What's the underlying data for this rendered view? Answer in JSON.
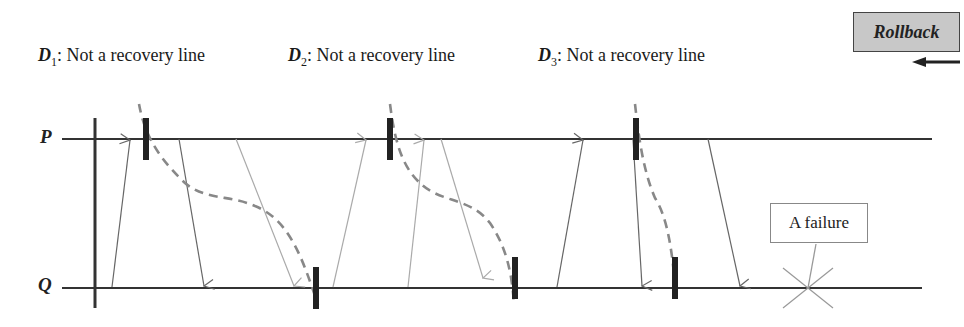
{
  "labels": {
    "d1": {
      "var": "D",
      "sub": "1",
      "text": ": Not a recovery line"
    },
    "d2": {
      "var": "D",
      "sub": "2",
      "text": ": Not a recovery line"
    },
    "d3": {
      "var": "D",
      "sub": "3",
      "text": ": Not a recovery line"
    }
  },
  "processes": {
    "p": "P",
    "q": "Q"
  },
  "rollback": {
    "label": "Rollback",
    "arrow_direction": "left"
  },
  "failure": {
    "label": "A failure",
    "marker": "x-star-icon"
  },
  "colors": {
    "timeline": "#333333",
    "checkpoint": "#222222",
    "message_dark": "#666666",
    "message_light": "#aaaaaa",
    "recovery_line": "#888888",
    "rollback_box": "#c8c8c8"
  },
  "diagram": {
    "p_y": 139,
    "q_y": 287,
    "start_x": 95,
    "checkpoints_p": [
      146,
      390,
      636
    ],
    "checkpoints_q": [
      316,
      515,
      675
    ],
    "messages": [
      {
        "from": "Q",
        "x1": 112,
        "to": "P",
        "x2": 130,
        "shade": "dark"
      },
      {
        "from": "P",
        "x1": 179,
        "to": "Q",
        "x2": 204,
        "shade": "dark"
      },
      {
        "from": "P",
        "x1": 236,
        "to": "Q",
        "x2": 294,
        "shade": "light"
      },
      {
        "from": "Q",
        "x1": 333,
        "to": "P",
        "x2": 366,
        "shade": "light"
      },
      {
        "from": "Q",
        "x1": 408,
        "to": "P",
        "x2": 423,
        "shade": "light"
      },
      {
        "from": "P",
        "x1": 441,
        "to": "Q",
        "x2": 483,
        "shade": "light"
      },
      {
        "from": "Q",
        "x1": 557,
        "to": "P",
        "x2": 583,
        "shade": "dark"
      },
      {
        "from": "P",
        "x1": 633,
        "to": "Q",
        "x2": 642,
        "shade": "dark"
      },
      {
        "from": "P",
        "x1": 708,
        "to": "Q",
        "x2": 740,
        "shade": "dark"
      }
    ]
  }
}
